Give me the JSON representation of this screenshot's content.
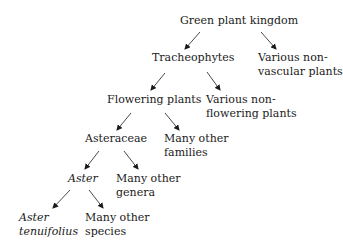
{
  "diagram": {
    "type": "taxonomy-tree",
    "nodes": {
      "root": {
        "lines": [
          "Green plant kingdom"
        ],
        "italic": false
      },
      "tracheophytes": {
        "lines": [
          "Tracheophytes"
        ],
        "italic": false
      },
      "nonvascular": {
        "lines": [
          "Various non-",
          "vascular plants"
        ],
        "italic": false
      },
      "flowering": {
        "lines": [
          "Flowering plants"
        ],
        "italic": false
      },
      "nonflowering": {
        "lines": [
          "Various non-",
          "flowering plants"
        ],
        "italic": false
      },
      "asteraceae": {
        "lines": [
          "Asteraceae"
        ],
        "italic": false
      },
      "otherfamilies": {
        "lines": [
          "Many other",
          "families"
        ],
        "italic": false
      },
      "aster": {
        "lines": [
          "Aster"
        ],
        "italic": true
      },
      "othergenera": {
        "lines": [
          "Many other",
          "genera"
        ],
        "italic": false
      },
      "tenuifolius": {
        "lines": [
          "Aster",
          "tenuifolius"
        ],
        "italic": true
      },
      "otherspecies": {
        "lines": [
          "Many other",
          "species"
        ],
        "italic": false
      }
    },
    "edges": [
      {
        "from": "root",
        "to": "tracheophytes"
      },
      {
        "from": "root",
        "to": "nonvascular"
      },
      {
        "from": "tracheophytes",
        "to": "flowering"
      },
      {
        "from": "tracheophytes",
        "to": "nonflowering"
      },
      {
        "from": "flowering",
        "to": "asteraceae"
      },
      {
        "from": "flowering",
        "to": "otherfamilies"
      },
      {
        "from": "asteraceae",
        "to": "aster"
      },
      {
        "from": "asteraceae",
        "to": "othergenera"
      },
      {
        "from": "aster",
        "to": "tenuifolius"
      },
      {
        "from": "aster",
        "to": "otherspecies"
      }
    ],
    "colors": {
      "text": "#1a1a1a",
      "arrow": "#1a1a1a",
      "background": "#ffffff"
    }
  }
}
